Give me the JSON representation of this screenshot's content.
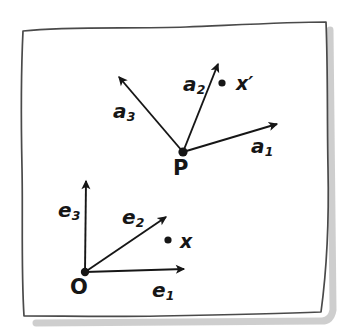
{
  "figure": {
    "background_color": "#ffffff",
    "ink_color": "#161616",
    "shadow_color": "#b9b9b9",
    "width": 344,
    "height": 333
  },
  "frame_border": {
    "name": "hand-drawn-page-outline",
    "corners": [
      {
        "x": 23,
        "y": 30
      },
      {
        "x": 326,
        "y": 22
      },
      {
        "x": 320,
        "y": 313
      },
      {
        "x": 23,
        "y": 316
      }
    ]
  },
  "origins": [
    {
      "id": "O",
      "label": "O",
      "x": 85,
      "y": 272,
      "label_x": 70,
      "label_y": 277,
      "dot_radius": 4.2
    },
    {
      "id": "P",
      "label": "P",
      "x": 183,
      "y": 152,
      "label_x": 173,
      "label_y": 158,
      "dot_radius": 4.6
    }
  ],
  "vectors": [
    {
      "id": "e1",
      "base": "O",
      "label": "e",
      "subscript": "1",
      "from": {
        "x": 85,
        "y": 272
      },
      "to": {
        "x": 184,
        "y": 269
      },
      "label_x": 152,
      "label_y": 280
    },
    {
      "id": "e2",
      "base": "O",
      "label": "e",
      "subscript": "2",
      "from": {
        "x": 85,
        "y": 272
      },
      "to": {
        "x": 166,
        "y": 217
      },
      "label_x": 122,
      "label_y": 207
    },
    {
      "id": "e3",
      "base": "O",
      "label": "e",
      "subscript": "3",
      "from": {
        "x": 85,
        "y": 272
      },
      "to": {
        "x": 86,
        "y": 181
      },
      "label_x": 58,
      "label_y": 200
    },
    {
      "id": "a1",
      "base": "P",
      "label": "a",
      "subscript": "1",
      "from": {
        "x": 183,
        "y": 152
      },
      "to": {
        "x": 277,
        "y": 124
      },
      "label_x": 251,
      "label_y": 136
    },
    {
      "id": "a2",
      "base": "P",
      "label": "a",
      "subscript": "2",
      "from": {
        "x": 183,
        "y": 152
      },
      "to": {
        "x": 218,
        "y": 64
      },
      "label_x": 183,
      "label_y": 74
    },
    {
      "id": "a3",
      "base": "P",
      "label": "a",
      "subscript": "3",
      "from": {
        "x": 183,
        "y": 152
      },
      "to": {
        "x": 119,
        "y": 77
      },
      "label_x": 113,
      "label_y": 101
    }
  ],
  "points": [
    {
      "id": "x",
      "label": "x",
      "dot_x": 168,
      "dot_y": 240,
      "dot_radius": 3.6,
      "label_x": 180,
      "label_y": 232
    },
    {
      "id": "xprime",
      "label": "x′",
      "dot_x": 222,
      "dot_y": 83,
      "dot_radius": 3.6,
      "label_x": 236,
      "label_y": 74
    }
  ]
}
